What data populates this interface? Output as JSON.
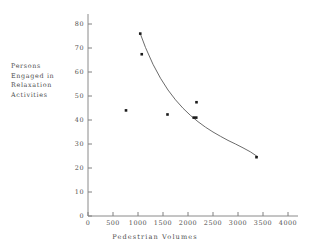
{
  "chart_data": {
    "type": "scatter",
    "title": "",
    "xlabel": "Pedestrian Volumes",
    "ylabel": "Persons Engaged in Relaxation Activities",
    "ylabel_lines": [
      "Persons",
      "Engaged in",
      "Relaxation",
      "Activities"
    ],
    "xlim": [
      0,
      4000
    ],
    "ylim": [
      0,
      80
    ],
    "xticks": [
      0,
      500,
      1000,
      1500,
      2000,
      2500,
      3000,
      3500,
      4000
    ],
    "xtick_labels": [
      "0",
      "500",
      "1000",
      "1500",
      "2000",
      "2500",
      "3000",
      "3500",
      "4000"
    ],
    "yticks": [
      0,
      10,
      20,
      30,
      40,
      50,
      60,
      70,
      80
    ],
    "ytick_labels": [
      "0",
      "10",
      "20",
      "30",
      "40",
      "50",
      "60",
      "70",
      "80"
    ],
    "grid": false,
    "legend": false,
    "marker_color": "#1a1a1a",
    "axis_color": "#808080",
    "curve_color": "#5a5a5a",
    "points": [
      {
        "x": 760,
        "y": 44.0
      },
      {
        "x": 1045,
        "y": 76.0
      },
      {
        "x": 1075,
        "y": 67.4
      },
      {
        "x": 1590,
        "y": 42.3
      },
      {
        "x": 2115,
        "y": 41.0
      },
      {
        "x": 2165,
        "y": 41.0
      },
      {
        "x": 2170,
        "y": 47.4
      },
      {
        "x": 3370,
        "y": 24.5
      }
    ],
    "fit_curve": {
      "name": "fitted trend",
      "x": [
        1045,
        1150,
        1300,
        1450,
        1600,
        1750,
        1900,
        2050,
        2200,
        2350,
        2500,
        2650,
        2800,
        2950,
        3100,
        3250,
        3400
      ],
      "y": [
        76.0,
        70.2,
        63.2,
        57.4,
        52.5,
        48.4,
        44.9,
        41.9,
        39.3,
        37.0,
        35.0,
        33.2,
        31.5,
        30.0,
        28.4,
        26.7,
        24.6
      ]
    }
  }
}
